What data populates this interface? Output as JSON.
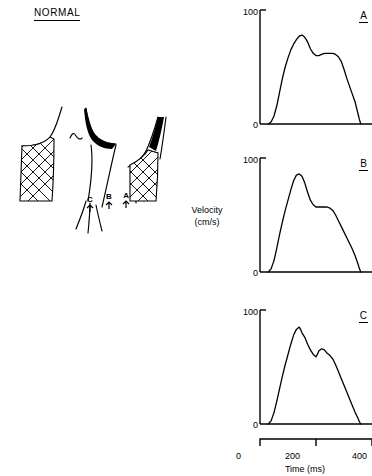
{
  "figure": {
    "panel_title": "NORMAL",
    "y_axis_label_line1": "Velocity",
    "y_axis_label_line2": "(cm/s)",
    "x_axis_label": "Time (ms)",
    "x_ticks": [
      "0",
      "200",
      "400"
    ],
    "x_range": [
      0,
      400
    ],
    "y_ticks": [
      "0",
      "100"
    ],
    "y_range": [
      0,
      100
    ]
  },
  "anatomy": {
    "name": "carotid-bifurcation-diagram",
    "sample_sites": [
      {
        "label": "C",
        "marker": "arrow"
      },
      {
        "label": "B",
        "marker": "arrow"
      },
      {
        "label": "A",
        "marker": "arrow"
      }
    ]
  },
  "panels": [
    {
      "letter": "A",
      "y_top": "100",
      "y_bottom": "0"
    },
    {
      "letter": "B",
      "y_top": "100",
      "y_bottom": "0"
    },
    {
      "letter": "C",
      "y_top": "100",
      "y_bottom": "0"
    }
  ],
  "chart_data": [
    {
      "type": "line",
      "title": "A",
      "xlabel": "Time (ms)",
      "ylabel": "Velocity (cm/s)",
      "xlim": [
        0,
        400
      ],
      "ylim": [
        0,
        100
      ],
      "grid": false,
      "legend": "none",
      "x": [
        30,
        40,
        50,
        60,
        70,
        80,
        90,
        100,
        110,
        120,
        130,
        140,
        150,
        160,
        170,
        180,
        190,
        200,
        210,
        220,
        230,
        240,
        250,
        260,
        270,
        280,
        290,
        300,
        310,
        320,
        330,
        340,
        350,
        355,
        360
      ],
      "y": [
        0,
        2,
        7,
        16,
        28,
        40,
        50,
        58,
        65,
        70,
        74,
        77,
        78,
        76,
        72,
        66,
        62,
        60,
        60,
        61,
        62,
        62,
        62,
        62,
        61,
        59,
        55,
        48,
        40,
        33,
        26,
        19,
        9,
        4,
        0
      ]
    },
    {
      "type": "line",
      "title": "B",
      "xlabel": "Time (ms)",
      "ylabel": "Velocity (cm/s)",
      "xlim": [
        0,
        400
      ],
      "ylim": [
        0,
        100
      ],
      "grid": false,
      "legend": "none",
      "x": [
        30,
        40,
        50,
        60,
        70,
        80,
        90,
        100,
        110,
        120,
        130,
        140,
        150,
        160,
        170,
        180,
        190,
        200,
        210,
        220,
        230,
        240,
        250,
        260,
        270,
        280,
        290,
        300,
        310,
        320,
        330,
        340,
        350,
        355,
        360
      ],
      "y": [
        0,
        3,
        10,
        21,
        33,
        44,
        54,
        63,
        72,
        80,
        85,
        86,
        84,
        78,
        70,
        63,
        59,
        57,
        57,
        57,
        57,
        57,
        56,
        54,
        50,
        45,
        40,
        35,
        30,
        25,
        20,
        14,
        7,
        3,
        0
      ]
    },
    {
      "type": "line",
      "title": "C",
      "xlabel": "Time (ms)",
      "ylabel": "Velocity (cm/s)",
      "xlim": [
        0,
        400
      ],
      "ylim": [
        0,
        100
      ],
      "grid": false,
      "legend": "none",
      "x": [
        30,
        40,
        50,
        60,
        70,
        80,
        90,
        100,
        110,
        120,
        130,
        140,
        145,
        150,
        160,
        170,
        180,
        190,
        200,
        205,
        210,
        220,
        230,
        240,
        250,
        260,
        270,
        280,
        290,
        300,
        310,
        320,
        330,
        340,
        350,
        355,
        360
      ],
      "y": [
        0,
        3,
        10,
        20,
        31,
        42,
        52,
        61,
        70,
        78,
        83,
        85,
        83,
        80,
        76,
        70,
        65,
        61,
        59,
        61,
        64,
        66,
        65,
        62,
        60,
        57,
        52,
        46,
        40,
        34,
        28,
        22,
        16,
        10,
        5,
        2,
        0
      ]
    }
  ]
}
